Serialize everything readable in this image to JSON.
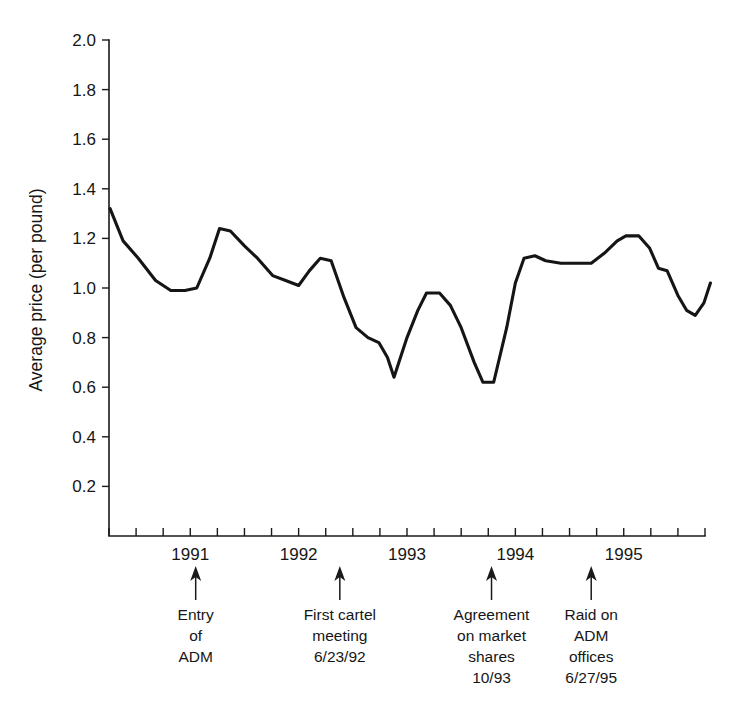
{
  "chart_data": {
    "type": "line",
    "title": "",
    "xlabel": "",
    "ylabel": "Average price (per pound)",
    "ylim": [
      0,
      2.0
    ],
    "xlim": [
      1990.25,
      1995.75
    ],
    "grid": false,
    "legend": "none",
    "y_ticks": [
      "0.2",
      "0.4",
      "0.6",
      "0.8",
      "1.0",
      "1.2",
      "1.4",
      "1.6",
      "1.8",
      "2.0"
    ],
    "y_tick_values": [
      0.2,
      0.4,
      0.6,
      0.8,
      1.0,
      1.2,
      1.4,
      1.6,
      1.8,
      2.0
    ],
    "x_ticks": [
      "1991",
      "1992",
      "1993",
      "1994",
      "1995"
    ],
    "x_tick_values": [
      1991,
      1992,
      1993,
      1994,
      1995
    ],
    "x_minor_interval": 0.25,
    "series": [
      {
        "name": "Average lysine price (per pound)",
        "x": [
          1990.25,
          1990.5,
          1990.75,
          1991.0,
          1991.25,
          1991.5,
          1991.75,
          1992.0,
          1992.25,
          1992.5,
          1992.75,
          1993.0,
          1993.25,
          1993.5,
          1993.75,
          1994.0,
          1994.25,
          1994.5,
          1994.75,
          1995.0,
          1995.25,
          1995.5,
          1995.75
        ],
        "values": [
          1.32,
          1.19,
          1.09,
          0.99,
          0.99,
          1.24,
          1.15,
          1.04,
          1.01,
          1.12,
          0.84,
          0.79,
          0.64,
          0.92,
          0.98,
          0.98,
          0.62,
          0.67,
          1.12,
          1.1,
          1.1,
          1.21,
          1.02
        ]
      }
    ],
    "detailed_points": [
      [
        1990.26,
        1.32
      ],
      [
        1990.38,
        1.19
      ],
      [
        1990.52,
        1.12
      ],
      [
        1990.68,
        1.03
      ],
      [
        1990.82,
        0.99
      ],
      [
        1990.95,
        0.99
      ],
      [
        1991.06,
        1.0
      ],
      [
        1991.18,
        1.12
      ],
      [
        1991.27,
        1.24
      ],
      [
        1991.37,
        1.23
      ],
      [
        1991.5,
        1.17
      ],
      [
        1991.62,
        1.12
      ],
      [
        1991.76,
        1.05
      ],
      [
        1991.88,
        1.03
      ],
      [
        1992.0,
        1.01
      ],
      [
        1992.1,
        1.07
      ],
      [
        1992.2,
        1.12
      ],
      [
        1992.3,
        1.11
      ],
      [
        1992.42,
        0.96
      ],
      [
        1992.53,
        0.84
      ],
      [
        1992.64,
        0.8
      ],
      [
        1992.74,
        0.78
      ],
      [
        1992.82,
        0.72
      ],
      [
        1992.88,
        0.64
      ],
      [
        1993.0,
        0.8
      ],
      [
        1993.1,
        0.91
      ],
      [
        1993.18,
        0.98
      ],
      [
        1993.3,
        0.98
      ],
      [
        1993.4,
        0.93
      ],
      [
        1993.5,
        0.84
      ],
      [
        1993.62,
        0.7
      ],
      [
        1993.7,
        0.62
      ],
      [
        1993.8,
        0.62
      ],
      [
        1993.92,
        0.84
      ],
      [
        1994.0,
        1.02
      ],
      [
        1994.08,
        1.12
      ],
      [
        1994.18,
        1.13
      ],
      [
        1994.28,
        1.11
      ],
      [
        1994.42,
        1.1
      ],
      [
        1994.58,
        1.1
      ],
      [
        1994.7,
        1.1
      ],
      [
        1994.82,
        1.14
      ],
      [
        1994.94,
        1.19
      ],
      [
        1995.02,
        1.21
      ],
      [
        1995.14,
        1.21
      ],
      [
        1995.24,
        1.16
      ],
      [
        1995.32,
        1.08
      ],
      [
        1995.4,
        1.07
      ],
      [
        1995.5,
        0.97
      ],
      [
        1995.58,
        0.91
      ],
      [
        1995.66,
        0.89
      ],
      [
        1995.74,
        0.94
      ],
      [
        1995.8,
        1.02
      ]
    ],
    "annotations": [
      {
        "id": "entry-of-adm",
        "x": 1991.05,
        "lines": [
          "Entry",
          "of",
          "ADM"
        ]
      },
      {
        "id": "first-cartel-meeting",
        "x": 1992.38,
        "lines": [
          "First cartel",
          "meeting",
          "6/23/92"
        ]
      },
      {
        "id": "agreement-on-market-shares",
        "x": 1993.78,
        "lines": [
          "Agreement",
          "on market",
          "shares",
          "10/93"
        ]
      },
      {
        "id": "raid-on-adm-offices",
        "x": 1994.7,
        "lines": [
          "Raid on",
          "ADM",
          "offices",
          "6/27/95"
        ]
      }
    ]
  },
  "axis": {
    "y_label": "Average price (per pound)"
  },
  "colors": {
    "line": "#151515",
    "axis": "#1a1a1a",
    "text": "#161616",
    "background": "#ffffff"
  },
  "footnote": {
    "mark": ""
  }
}
